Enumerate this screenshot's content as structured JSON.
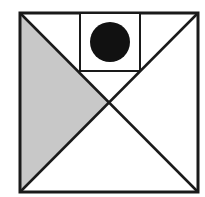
{
  "diagram": {
    "colors": {
      "stroke": "#1a1a1a",
      "shade": "#c8c8c8",
      "circle": "#111111",
      "background": "#ffffff"
    },
    "outer_square": {
      "x1": 20,
      "y1": 13,
      "x2": 198,
      "y2": 192
    },
    "inner_square": {
      "x1": 80,
      "y1": 13,
      "x2": 140,
      "y2": 71
    },
    "circle": {
      "cx": 110,
      "cy": 42,
      "r": 20
    },
    "shaded_region": "left-triangle"
  }
}
